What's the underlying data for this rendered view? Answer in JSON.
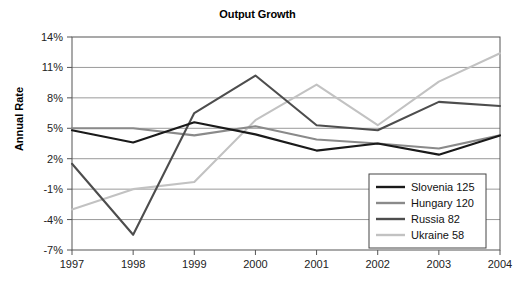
{
  "chart_data": {
    "type": "line",
    "title": "Output Growth",
    "xlabel": "",
    "ylabel": "Annual Rate",
    "x": [
      1997,
      1998,
      1999,
      2000,
      2001,
      2002,
      2003,
      2004
    ],
    "xtick_labels": [
      "1997",
      "1998",
      "1999",
      "2000",
      "2001",
      "2002",
      "2003",
      "2004"
    ],
    "ytick_labels": [
      "14%",
      "11%",
      "8%",
      "5%",
      "2%",
      "-1%",
      "-4%",
      "-7%"
    ],
    "ytick_values": [
      14,
      11,
      8,
      5,
      2,
      -1,
      -4,
      -7
    ],
    "ylim": [
      -7,
      14
    ],
    "xlim": [
      1997,
      2004
    ],
    "grid": true,
    "legend_position": "lower right",
    "series": [
      {
        "name": "Slovenia 125",
        "label": "Slovenia 125",
        "color": "#1a1a1a",
        "width": 2.1,
        "values": [
          4.8,
          3.6,
          5.6,
          4.4,
          2.8,
          3.5,
          2.4,
          4.3
        ]
      },
      {
        "name": "Hungary 120",
        "label": "Hungary 120",
        "color": "#8a8a8a",
        "width": 2.1,
        "values": [
          5.0,
          5.0,
          4.3,
          5.2,
          3.9,
          3.5,
          3.0,
          4.3
        ]
      },
      {
        "name": "Russia  82",
        "label": "Russia  82",
        "color": "#4d4d4d",
        "width": 2.1,
        "values": [
          1.5,
          -5.5,
          6.5,
          10.2,
          5.3,
          4.8,
          7.6,
          7.2
        ]
      },
      {
        "name": "Ukraine  58",
        "label": "Ukraine  58",
        "color": "#c2c2c2",
        "width": 2.1,
        "values": [
          -3.0,
          -1.0,
          -0.3,
          5.8,
          9.3,
          5.3,
          9.6,
          12.4
        ]
      }
    ]
  },
  "axes": {
    "frame_color": "#555555",
    "grid_color": "#9a9a9a"
  }
}
